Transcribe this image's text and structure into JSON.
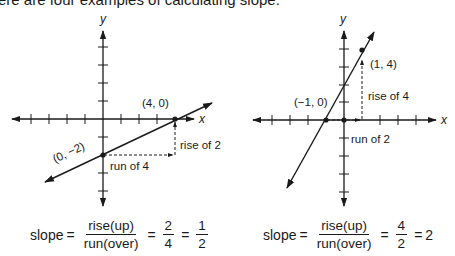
{
  "header": {
    "text": "ere are four examples of calculating slope."
  },
  "left_graph": {
    "x_axis_label": "x",
    "y_axis_label": "y",
    "points": [
      {
        "label": "(0, −2)",
        "x": 0,
        "y": -2
      },
      {
        "label": "(4, 0)",
        "x": 4,
        "y": 0
      }
    ],
    "run_label": "run of 4",
    "rise_label": "rise of 2",
    "formula": {
      "prefix": "slope",
      "eq": "=",
      "numerator": "rise(up)",
      "denominator": "run(over)",
      "frac2_num": "2",
      "frac2_den": "4",
      "frac3_num": "1",
      "frac3_den": "2"
    }
  },
  "right_graph": {
    "x_axis_label": "x",
    "y_axis_label": "y",
    "points": [
      {
        "label": "(−1, 0)",
        "x": -1,
        "y": 0
      },
      {
        "label": "(1, 4)",
        "x": 1,
        "y": 4
      }
    ],
    "run_label": "run of 2",
    "rise_label": "rise of 4",
    "formula": {
      "prefix": "slope",
      "eq": "=",
      "numerator": "rise(up)",
      "denominator": "run(over)",
      "frac2_num": "4",
      "frac2_den": "2",
      "result": "2"
    }
  },
  "colors": {
    "ink": "#1a1a1a",
    "background": "#ffffff"
  }
}
